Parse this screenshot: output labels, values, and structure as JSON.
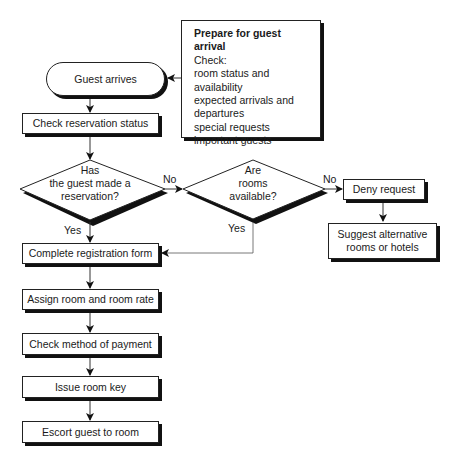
{
  "diagram": {
    "type": "flowchart",
    "prep_note": {
      "title": "Prepare for guest arrival",
      "lines": [
        "Check:",
        "room status and",
        "availability",
        "expected arrivals and",
        "departures",
        "special requests",
        "important guests"
      ]
    },
    "start": "Guest arrives",
    "steps": {
      "check_reservation": "Check reservation status",
      "complete_form": "Complete registration form",
      "assign_room": "Assign room and room rate",
      "check_payment": "Check method of payment",
      "issue_key": "Issue room key",
      "escort": "Escort guest to room",
      "deny": "Deny request",
      "suggest": "Suggest alternative rooms or hotels"
    },
    "decisions": {
      "reservation": {
        "lines": [
          "Has",
          "the guest made a",
          "reservation?"
        ],
        "yes": "Yes",
        "no": "No"
      },
      "rooms": {
        "lines": [
          "Are",
          "rooms",
          "available?"
        ],
        "yes": "Yes",
        "no": "No"
      }
    },
    "suggest_lines": [
      "Suggest alternative",
      "rooms or hotels"
    ]
  }
}
